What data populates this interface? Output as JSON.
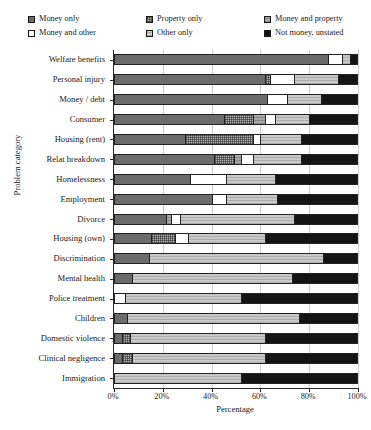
{
  "chart_data": {
    "type": "bar",
    "orientation": "horizontal",
    "stacked": true,
    "normalized": true,
    "title": "",
    "xlabel": "Percentage",
    "ylabel": "Problem category",
    "xlim": [
      0,
      100
    ],
    "xticks": [
      "0%",
      "20%",
      "40%",
      "60%",
      "80%",
      "100%"
    ],
    "xtick_values": [
      0,
      20,
      40,
      60,
      80,
      100
    ],
    "grid": true,
    "legend_position": "top",
    "categories": [
      "Welfare benefits",
      "Personal injury",
      "Money / debt",
      "Consumer",
      "Housing (rent)",
      "Relat breakdown",
      "Homelessness",
      "Employment",
      "Divorce",
      "Housing (own)",
      "Discrimination",
      "Mental health",
      "Police treatment",
      "Children",
      "Domestic violence",
      "Clinical negligence",
      "Immigration"
    ],
    "series": [
      {
        "name": "Money only",
        "key": "money-only",
        "fill": "f-money-only",
        "color": "#6b6b6b",
        "values": [
          88,
          62,
          63,
          45,
          29,
          41,
          31,
          40,
          21,
          15,
          14,
          7,
          0,
          5,
          3,
          3,
          0
        ]
      },
      {
        "name": "Property only",
        "key": "property-only",
        "fill": "f-property-only",
        "color": "#b4b4b4",
        "values": [
          0,
          2,
          0,
          12,
          28,
          8,
          0,
          0,
          0,
          10,
          0,
          0,
          0,
          0,
          3,
          4,
          0
        ]
      },
      {
        "name": "Money and property",
        "key": "money-and-property",
        "fill": "f-money-and-property",
        "color": "#a8a8a8",
        "values": [
          0,
          0,
          0,
          5,
          0,
          3,
          0,
          0,
          2,
          0,
          0,
          0,
          0,
          0,
          0,
          0,
          0
        ]
      },
      {
        "name": "Money and other",
        "key": "money-and-other",
        "fill": "f-money-and-other",
        "color": "#ffffff",
        "values": [
          6,
          10,
          8,
          4,
          3,
          5,
          15,
          6,
          4,
          5,
          0,
          0,
          4,
          0,
          0,
          0,
          0
        ]
      },
      {
        "name": "Other only",
        "key": "other-only",
        "fill": "f-other-only",
        "color": "#c9c9c9",
        "values": [
          3,
          18,
          14,
          14,
          17,
          20,
          20,
          21,
          47,
          32,
          72,
          66,
          48,
          71,
          56,
          55,
          52
        ]
      },
      {
        "name": "Not money, unstated",
        "key": "not-money-unstated",
        "fill": "f-not-money",
        "color": "#141414",
        "values": [
          3,
          8,
          15,
          20,
          23,
          23,
          34,
          33,
          26,
          38,
          14,
          27,
          48,
          24,
          38,
          38,
          48
        ]
      }
    ]
  },
  "legend": {
    "items": [
      {
        "label": "Money only",
        "fill": "f-money-only"
      },
      {
        "label": "Property only",
        "fill": "f-property-only"
      },
      {
        "label": "Money and property",
        "fill": "f-money-and-property"
      },
      {
        "label": "Money and other",
        "fill": "f-money-and-other"
      },
      {
        "label": "Other only",
        "fill": "f-other-only"
      },
      {
        "label": "Not money, unstated",
        "fill": "f-not-money"
      }
    ]
  }
}
